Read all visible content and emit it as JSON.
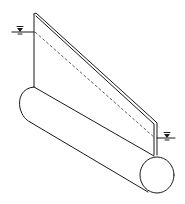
{
  "figure": {
    "symbols": {
      "upstream_water_level": "water-level-marker",
      "downstream_water_level": "water-level-marker"
    },
    "colors": {
      "line": "#1a1a1a",
      "background": "#ffffff"
    }
  }
}
